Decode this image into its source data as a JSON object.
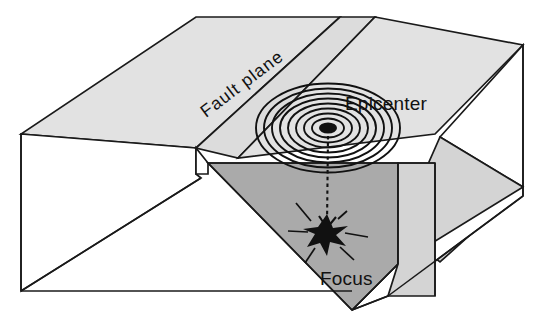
{
  "diagram": {
    "background_color": "#ffffff",
    "line_color": "#1a1a1a",
    "colors": {
      "top_surface": "#e2e2e2",
      "fault_plane_band": "#dcdcdc",
      "fault_plane_face": "#aaaaaa",
      "footwall_face": "#d4d4d4",
      "white_face": "#ffffff",
      "ink": "#111111"
    },
    "labels": {
      "fault_plane": "Fault plane",
      "epicenter": "Epicenter",
      "focus": "Focus"
    },
    "label_positions": {
      "fault_plane": {
        "x": 206,
        "y": 118,
        "rotation_deg": -37
      },
      "epicenter": {
        "x": 345,
        "y": 110
      },
      "focus": {
        "x": 320,
        "y": 285
      }
    },
    "epicenter": {
      "x": 328,
      "y": 128,
      "dot_rx": 9,
      "dot_ry": 5.5,
      "ring_count": 8,
      "ring_rx": [
        16,
        24,
        32,
        40,
        48,
        56,
        64,
        72
      ],
      "ring_ry": [
        9.5,
        14.5,
        19.5,
        24.5,
        29.5,
        34.5,
        39.5,
        44.5
      ]
    },
    "focus": {
      "x": 327,
      "y": 234,
      "star_points": 9,
      "ray_count": 6
    },
    "arrow": {
      "from_x": 328,
      "from_y": 136,
      "to_x": 327,
      "to_y": 228,
      "style": "dashed",
      "head": "open-chevron"
    },
    "geometry": {
      "note": "Two crustal blocks separated by an inclined fault plane; the right-front block is the hanging wall cut away to expose the fault surface."
    }
  }
}
